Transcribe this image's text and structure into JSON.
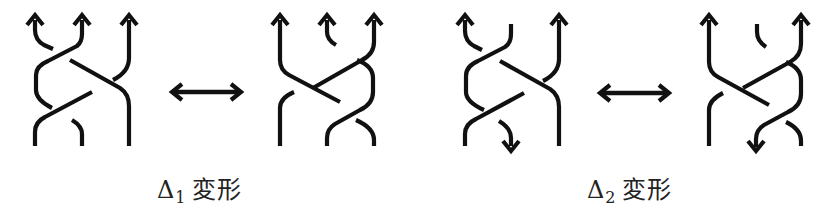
{
  "figure": {
    "groups": [
      {
        "id": "delta1",
        "label_symbol": "Δ",
        "label_subscript": "1",
        "label_text": "変形",
        "relation": "↔"
      },
      {
        "id": "delta2",
        "label_symbol": "Δ",
        "label_subscript": "2",
        "label_text": "変形",
        "relation": "↔"
      }
    ]
  },
  "colors": {
    "ink": "#111111",
    "background": "#ffffff"
  }
}
